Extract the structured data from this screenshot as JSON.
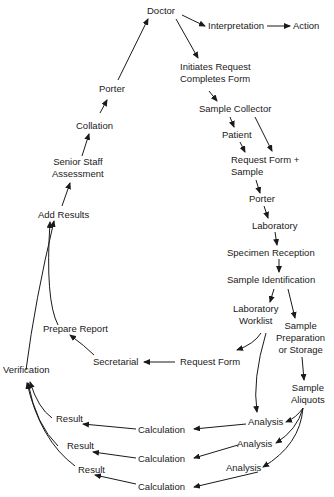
{
  "diagram": {
    "nodes": {
      "doctor": "Doctor",
      "interpretation": "Interpretation",
      "action": "Action",
      "initiates_1": "Initiates Request",
      "initiates_2": "Completes Form",
      "sample_collector": "Sample Collector",
      "patient": "Patient",
      "request_form_sample_1": "Request Form +",
      "request_form_sample_2": "Sample",
      "porter_right": "Porter",
      "laboratory": "Laboratory",
      "specimen_reception": "Specimen Reception",
      "sample_identification": "Sample Identification",
      "lab_worklist_1": "Laboratory",
      "lab_worklist_2": "Worklist",
      "sample_prep_1": "Sample",
      "sample_prep_2": "Preparation",
      "sample_prep_3": "or Storage",
      "sample_aliquots_1": "Sample",
      "sample_aliquots_2": "Aliquots",
      "request_form": "Request Form",
      "secretarial": "Secretarial",
      "prepare_report": "Prepare Report",
      "verification": "Verification",
      "add_results": "Add Results",
      "senior_1": "Senior Staff",
      "senior_2": "Assessment",
      "collation": "Collation",
      "porter_left": "Porter",
      "analysis_1": "Analysis",
      "analysis_2": "Analysis",
      "analysis_3": "Analysis",
      "calculation_1": "Calculation",
      "calculation_2": "Calculation",
      "calculation_3": "Calculation",
      "result_1": "Result",
      "result_2": "Result",
      "result_3": "Result"
    },
    "edges": [
      [
        "Doctor",
        "Interpretation"
      ],
      [
        "Interpretation",
        "Action"
      ],
      [
        "Doctor",
        "Initiates Request / Completes Form"
      ],
      [
        "Initiates Request / Completes Form",
        "Sample Collector"
      ],
      [
        "Sample Collector",
        "Patient"
      ],
      [
        "Sample Collector",
        "Request Form + Sample"
      ],
      [
        "Patient",
        "Request Form + Sample"
      ],
      [
        "Request Form + Sample",
        "Porter"
      ],
      [
        "Porter",
        "Laboratory"
      ],
      [
        "Laboratory",
        "Specimen Reception"
      ],
      [
        "Specimen Reception",
        "Sample Identification"
      ],
      [
        "Sample Identification",
        "Laboratory Worklist"
      ],
      [
        "Sample Identification",
        "Sample Preparation or Storage"
      ],
      [
        "Laboratory Worklist",
        "Request Form"
      ],
      [
        "Laboratory Worklist",
        "Analysis"
      ],
      [
        "Sample Preparation or Storage",
        "Sample Aliquots"
      ],
      [
        "Sample Aliquots",
        "Analysis (x3)"
      ],
      [
        "Analysis",
        "Calculation"
      ],
      [
        "Calculation",
        "Result"
      ],
      [
        "Result",
        "Verification"
      ],
      [
        "Request Form",
        "Secretarial"
      ],
      [
        "Secretarial",
        "Prepare Report"
      ],
      [
        "Prepare Report",
        "Add Results"
      ],
      [
        "Verification",
        "Add Results"
      ],
      [
        "Add Results",
        "Senior Staff Assessment"
      ],
      [
        "Senior Staff Assessment",
        "Collation"
      ],
      [
        "Collation",
        "Porter"
      ],
      [
        "Porter",
        "Doctor"
      ]
    ]
  }
}
